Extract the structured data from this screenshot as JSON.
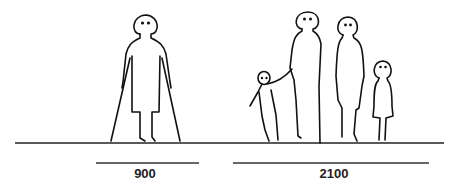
{
  "diagram": {
    "groups": [
      {
        "name": "person-with-crutches",
        "dimension_label": "900"
      },
      {
        "name": "family-group",
        "dimension_label": "2100"
      }
    ],
    "colors": {
      "ink": "#111111",
      "background": "#ffffff"
    }
  }
}
